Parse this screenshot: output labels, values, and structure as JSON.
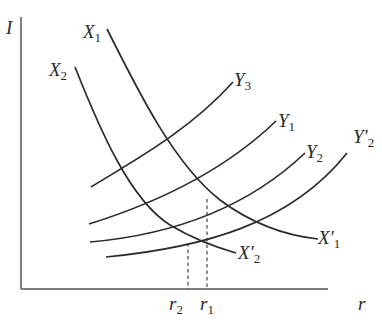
{
  "diagram": {
    "type": "economics-curve-diagram",
    "axes": {
      "y_label": "I",
      "x_label": "r"
    },
    "curves": {
      "X1": {
        "label_main": "X",
        "label_sub": "1",
        "end_label_main": "X'",
        "end_label_sub": "1"
      },
      "X2": {
        "label_main": "X",
        "label_sub": "2",
        "end_label_main": "X'",
        "end_label_sub": "2"
      },
      "Y3": {
        "label_main": "Y",
        "label_sub": "3"
      },
      "Y1": {
        "label_main": "Y",
        "label_sub": "1"
      },
      "Y2": {
        "label_main": "Y",
        "label_sub": "2"
      },
      "Yp2": {
        "label_main": "Y'",
        "label_sub": "2"
      }
    },
    "markers": {
      "r2": {
        "main": "r",
        "sub": "2"
      },
      "r1": {
        "main": "r",
        "sub": "1"
      }
    },
    "colors": {
      "line": "#2b2b2b",
      "axis": "#555555",
      "background": "#ffffff"
    }
  }
}
